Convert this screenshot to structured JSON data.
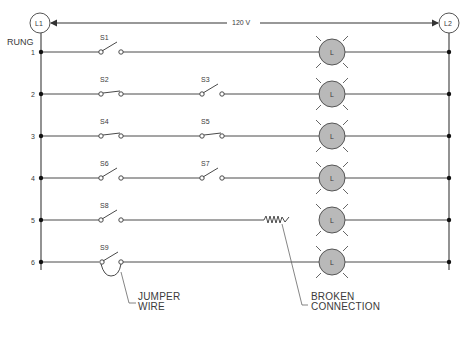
{
  "diagram": {
    "supply": {
      "left_terminal": "L1",
      "right_terminal": "L2",
      "voltage": "120 V"
    },
    "rung_header": "RUNG",
    "rungs": [
      {
        "number": "1",
        "switches": [
          {
            "label": "S1",
            "state": "open"
          }
        ],
        "lamp": "L"
      },
      {
        "number": "2",
        "switches": [
          {
            "label": "S2",
            "state": "closed"
          },
          {
            "label": "S3",
            "state": "open"
          }
        ],
        "lamp": "L"
      },
      {
        "number": "3",
        "switches": [
          {
            "label": "S4",
            "state": "closed"
          },
          {
            "label": "S5",
            "state": "closed"
          }
        ],
        "lamp": "L"
      },
      {
        "number": "4",
        "switches": [
          {
            "label": "S6",
            "state": "open"
          },
          {
            "label": "S7",
            "state": "open"
          }
        ],
        "lamp": "L"
      },
      {
        "number": "5",
        "switches": [
          {
            "label": "S8",
            "state": "open"
          }
        ],
        "fault": "broken connection",
        "lamp": "L"
      },
      {
        "number": "6",
        "switches": [
          {
            "label": "S9",
            "state": "open",
            "jumpered": true
          }
        ],
        "lamp": "L"
      }
    ],
    "callouts": {
      "jumper_line1": "JUMPER",
      "jumper_line2": "WIRE",
      "broken_line1": "BROKEN",
      "broken_line2": "CONNECTION"
    },
    "colors": {
      "wire": "#4a4a4a",
      "lamp_fill": "#b9b9b9",
      "lamp_stroke": "#555555",
      "text": "#3a3a3a"
    }
  }
}
